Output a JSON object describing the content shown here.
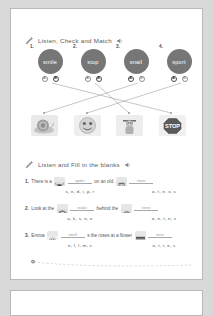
{
  "worksheet": {
    "sections": [
      {
        "id": "match",
        "heading": "Listen, Check and Match",
        "pencil_icon": "pencil-icon",
        "speaker_icon": "speaker-icon",
        "items": [
          {
            "number": "1.",
            "word": "smile",
            "options": [
              "A",
              "B"
            ],
            "selected": "B"
          },
          {
            "number": "2.",
            "word": "stop",
            "options": [
              "A",
              "B"
            ],
            "selected": "B"
          },
          {
            "number": "3.",
            "word": "snail",
            "options": [
              "A",
              "B"
            ],
            "selected": "A"
          },
          {
            "number": "4.",
            "word": "sport",
            "options": [
              "A",
              "B"
            ],
            "selected": "A"
          }
        ],
        "pictures": [
          {
            "id": "snail-picture",
            "label": "snail"
          },
          {
            "id": "smile-picture",
            "label": "smile"
          },
          {
            "id": "sport-picture",
            "label": "sport"
          },
          {
            "id": "stop-picture",
            "label": "STOP"
          }
        ]
      },
      {
        "id": "fill",
        "heading": "Listen and Fill in the blanks",
        "pencil_icon": "pencil-icon",
        "speaker_icon": "speaker-icon",
        "questions": [
          {
            "number": "1.",
            "before": "There is a",
            "middle": "on an old",
            "after": "",
            "blank1_label": "spider",
            "blank2_label": "stove",
            "image1": "spider-picture",
            "image2": "stove-picture",
            "letters1": "s, e, d, i, p, r",
            "letters2": "o, t, e, v, s"
          },
          {
            "number": "2.",
            "before": "Look at the",
            "middle": "behind the",
            "after": "",
            "blank1_label": "snake",
            "blank2_label": "stone",
            "image1": "snake-picture",
            "image2": "stone-picture",
            "letters1": "a, k, s, n, e",
            "letters2": "o, e, t, n, s"
          },
          {
            "number": "3.",
            "before": "Emma",
            "middle": "s the roses at a flower",
            "after": "",
            "blank1_label": "smell",
            "blank2_label": "store",
            "image1": "smell-picture",
            "image2": "store-picture",
            "letters1": "e, l, l, m, s",
            "letters2": "o, t, r, e, s"
          }
        ]
      }
    ],
    "footer": {
      "icon": "flower-icon"
    }
  },
  "colors": {
    "bubble": "#767676",
    "page": "#ffffff",
    "background": "#d9d9d9",
    "text": "#555555",
    "line": "#9a9a9a"
  }
}
